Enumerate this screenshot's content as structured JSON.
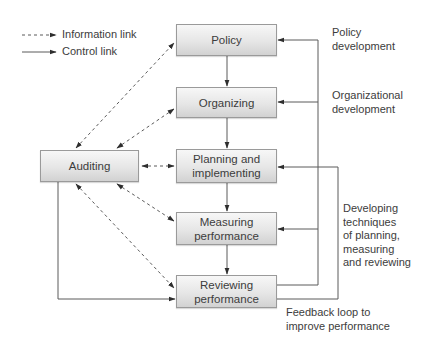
{
  "legend": {
    "information_link": "Information link",
    "control_link": "Control link"
  },
  "nodes": {
    "policy": "Policy",
    "organizing": "Organizing",
    "planning": "Planning and\nimplementing",
    "measuring": "Measuring\nperformance",
    "reviewing": "Reviewing\nperformance",
    "auditing": "Auditing"
  },
  "annotations": {
    "policy_development": "Policy\ndevelopment",
    "organizational_development": "Organizational\ndevelopment",
    "developing_techniques": "Developing\ntechniques\nof planning,\nmeasuring\nand reviewing",
    "feedback_loop": "Feedback loop to\nimprove performance"
  },
  "colors": {
    "line": "#5a5a5a",
    "box_border": "#9a9a9a",
    "text": "#3c3c3c"
  }
}
